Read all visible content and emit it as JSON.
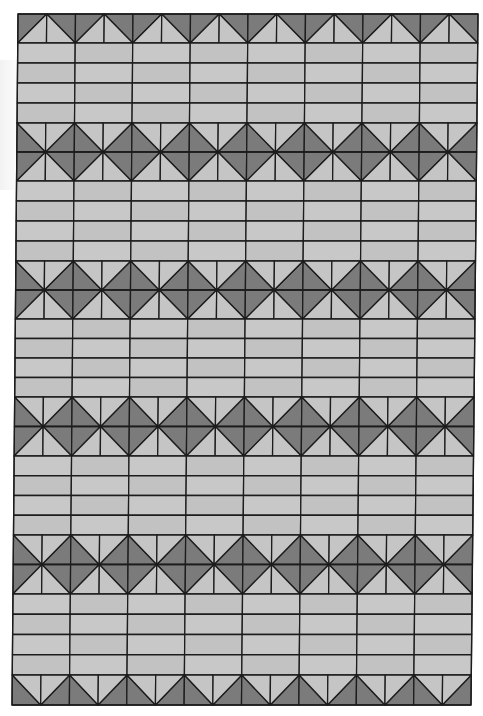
{
  "diagram": {
    "type": "quilt-pattern",
    "columns": 8,
    "frame": {
      "top_left": [
        18,
        14
      ],
      "top_right": [
        478,
        14
      ],
      "bottom_left": [
        12,
        705
      ],
      "bottom_right": [
        471,
        705
      ]
    },
    "rows": [
      {
        "kind": "half-top",
        "height": 29
      },
      {
        "kind": "stripes",
        "count": 4,
        "height": 80
      },
      {
        "kind": "hourglass",
        "height": 58
      },
      {
        "kind": "stripes",
        "count": 4,
        "height": 80
      },
      {
        "kind": "hourglass",
        "height": 58
      },
      {
        "kind": "stripes",
        "count": 4,
        "height": 78
      },
      {
        "kind": "hourglass",
        "height": 59
      },
      {
        "kind": "stripes",
        "count": 4,
        "height": 79
      },
      {
        "kind": "hourglass",
        "height": 59
      },
      {
        "kind": "stripes",
        "count": 4,
        "height": 81
      },
      {
        "kind": "half-bottom",
        "height": 30
      }
    ],
    "colors": {
      "dark": "#7b7b7b",
      "light": "#c5c5c5",
      "stripe": "#c8c8c8",
      "stripe_alt": "#c2c2c2",
      "line": "#1c1c1c",
      "background": "#ffffff"
    }
  }
}
